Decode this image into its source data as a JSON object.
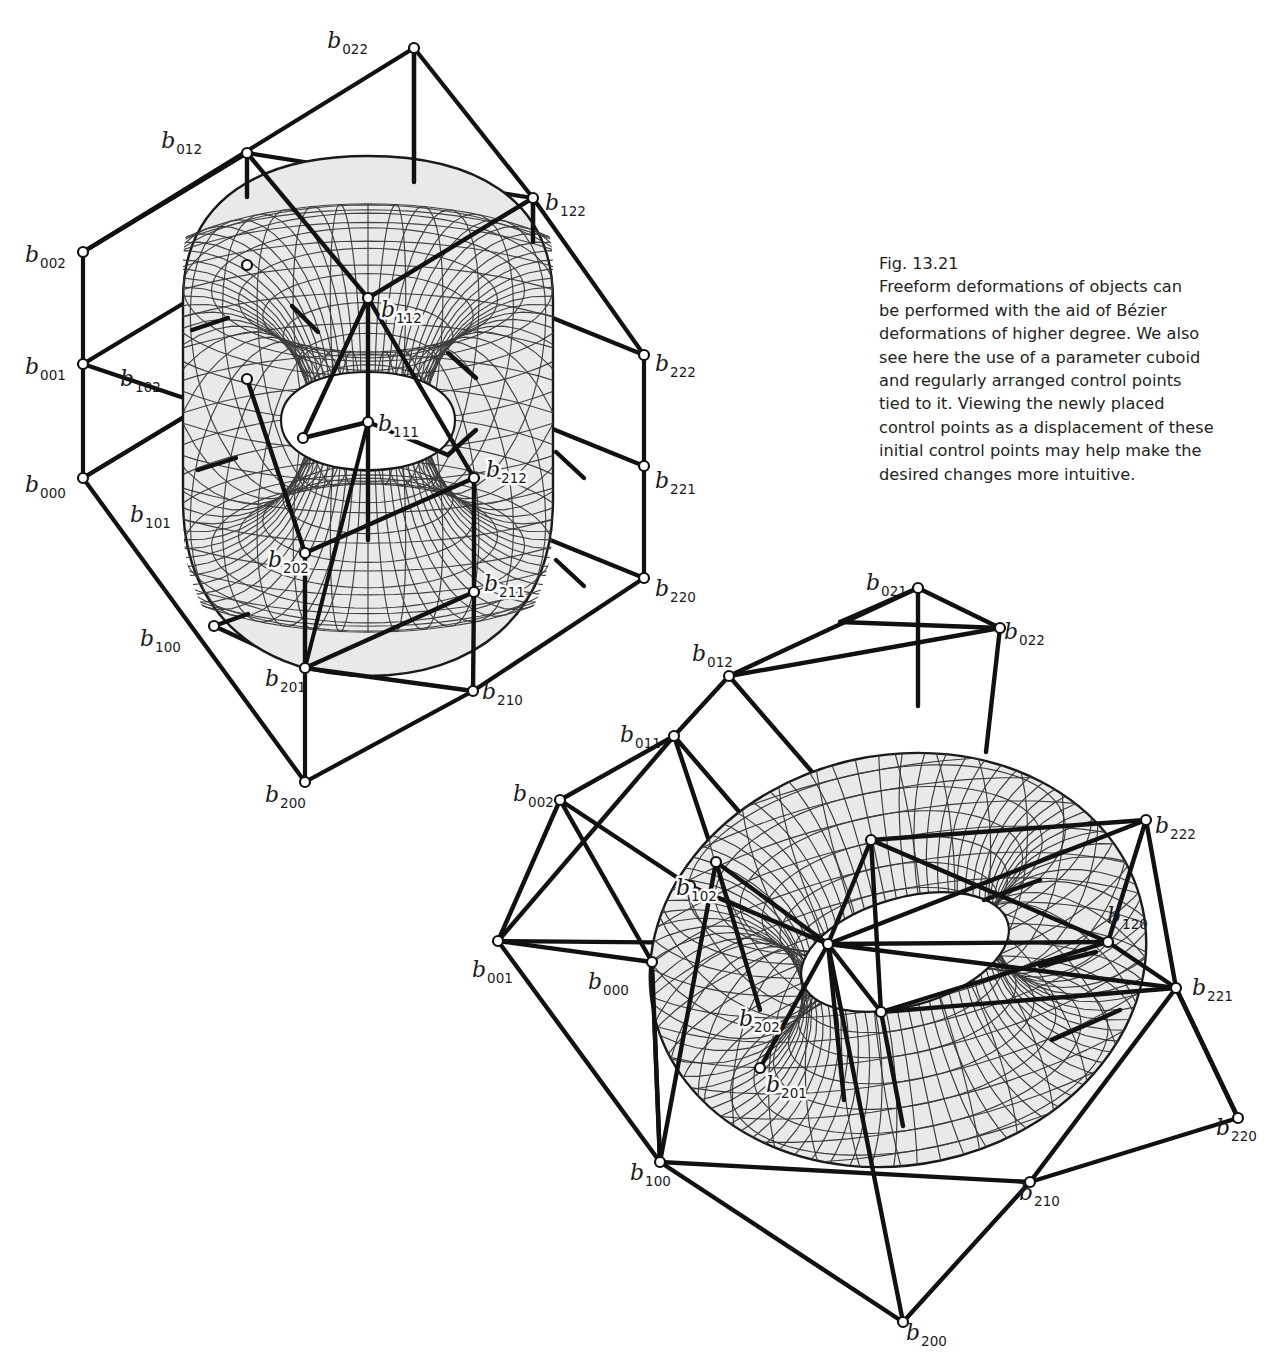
{
  "figure": {
    "number": "Fig. 13.21",
    "caption_lines": [
      "Fig. 13.21",
      "Freeform deformations of objects can",
      "be performed with the aid of Bézier",
      "deformations of higher degree. We also",
      "see here the use of a parameter cuboid",
      "and regularly arranged control points",
      "tied to it. Viewing the newly placed",
      "control points as a displacement of these",
      "initial control points may help make the",
      "desired changes more intuitive."
    ],
    "background": "#ffffff",
    "ink": "#111111",
    "mesh_line": "#333333",
    "surface_fill": "#e9e9e9"
  },
  "panels": [
    {
      "id": "undeformed",
      "name": "parameter-cuboid-with-torus",
      "labels": [
        {
          "base": "b",
          "sub": "022",
          "x": 368,
          "y": 48,
          "anchor": "end",
          "onsurface": false
        },
        {
          "base": "b",
          "sub": "012",
          "x": 202,
          "y": 148,
          "anchor": "end",
          "onsurface": false
        },
        {
          "base": "b",
          "sub": "122",
          "x": 545,
          "y": 210,
          "anchor": "start",
          "onsurface": false
        },
        {
          "base": "b",
          "sub": "002",
          "x": 25,
          "y": 262,
          "anchor": "start",
          "onsurface": false
        },
        {
          "base": "b",
          "sub": "001",
          "x": 25,
          "y": 374,
          "anchor": "start",
          "onsurface": false
        },
        {
          "base": "b",
          "sub": "000",
          "x": 25,
          "y": 492,
          "anchor": "start",
          "onsurface": false
        },
        {
          "base": "b",
          "sub": "102",
          "x": 120,
          "y": 386,
          "anchor": "start",
          "onsurface": false
        },
        {
          "base": "b",
          "sub": "101",
          "x": 130,
          "y": 522,
          "anchor": "start",
          "onsurface": false
        },
        {
          "base": "b",
          "sub": "100",
          "x": 140,
          "y": 646,
          "anchor": "start",
          "onsurface": false
        },
        {
          "base": "b",
          "sub": "112",
          "x": 381,
          "y": 317,
          "anchor": "start",
          "onsurface": true
        },
        {
          "base": "b",
          "sub": "111",
          "x": 378,
          "y": 431,
          "anchor": "start",
          "onsurface": true
        },
        {
          "base": "b",
          "sub": "222",
          "x": 655,
          "y": 371,
          "anchor": "start",
          "onsurface": false
        },
        {
          "base": "b",
          "sub": "221",
          "x": 655,
          "y": 488,
          "anchor": "start",
          "onsurface": false
        },
        {
          "base": "b",
          "sub": "220",
          "x": 655,
          "y": 596,
          "anchor": "start",
          "onsurface": false
        },
        {
          "base": "b",
          "sub": "212",
          "x": 486,
          "y": 477,
          "anchor": "start",
          "onsurface": true
        },
        {
          "base": "b",
          "sub": "211",
          "x": 484,
          "y": 591,
          "anchor": "start",
          "onsurface": true
        },
        {
          "base": "b",
          "sub": "202",
          "x": 268,
          "y": 567,
          "anchor": "start",
          "onsurface": true
        },
        {
          "base": "b",
          "sub": "201",
          "x": 265,
          "y": 686,
          "anchor": "start",
          "onsurface": false
        },
        {
          "base": "b",
          "sub": "210",
          "x": 482,
          "y": 699,
          "anchor": "start",
          "onsurface": false
        },
        {
          "base": "b",
          "sub": "200",
          "x": 265,
          "y": 802,
          "anchor": "start",
          "onsurface": false
        }
      ]
    },
    {
      "id": "deformed",
      "name": "deformed-control-net-with-torus",
      "labels": [
        {
          "base": "b",
          "sub": "021",
          "x": 866,
          "y": 590,
          "anchor": "start",
          "onsurface": false
        },
        {
          "base": "b",
          "sub": "022",
          "x": 1004,
          "y": 639,
          "anchor": "start",
          "onsurface": false
        },
        {
          "base": "b",
          "sub": "012",
          "x": 692,
          "y": 661,
          "anchor": "start",
          "onsurface": false
        },
        {
          "base": "b",
          "sub": "011",
          "x": 620,
          "y": 742,
          "anchor": "start",
          "onsurface": false
        },
        {
          "base": "b",
          "sub": "002",
          "x": 513,
          "y": 801,
          "anchor": "start",
          "onsurface": false
        },
        {
          "base": "b",
          "sub": "001",
          "x": 472,
          "y": 977,
          "anchor": "start",
          "onsurface": false
        },
        {
          "base": "b",
          "sub": "000",
          "x": 588,
          "y": 989,
          "anchor": "start",
          "onsurface": false
        },
        {
          "base": "b",
          "sub": "102",
          "x": 676,
          "y": 895,
          "anchor": "start",
          "onsurface": true
        },
        {
          "base": "b",
          "sub": "222",
          "x": 1155,
          "y": 833,
          "anchor": "start",
          "onsurface": false
        },
        {
          "base": "b",
          "sub": "120",
          "x": 1107,
          "y": 923,
          "anchor": "start",
          "onsurface": false
        },
        {
          "base": "b",
          "sub": "221",
          "x": 1192,
          "y": 995,
          "anchor": "start",
          "onsurface": false
        },
        {
          "base": "b",
          "sub": "220",
          "x": 1216,
          "y": 1135,
          "anchor": "start",
          "onsurface": false
        },
        {
          "base": "b",
          "sub": "202",
          "x": 739,
          "y": 1026,
          "anchor": "start",
          "onsurface": true
        },
        {
          "base": "b",
          "sub": "201",
          "x": 766,
          "y": 1092,
          "anchor": "start",
          "onsurface": true
        },
        {
          "base": "b",
          "sub": "100",
          "x": 630,
          "y": 1180,
          "anchor": "start",
          "onsurface": false
        },
        {
          "base": "b",
          "sub": "210",
          "x": 1019,
          "y": 1200,
          "anchor": "start",
          "onsurface": false
        },
        {
          "base": "b",
          "sub": "200",
          "x": 906,
          "y": 1340,
          "anchor": "start",
          "onsurface": false
        }
      ]
    }
  ]
}
